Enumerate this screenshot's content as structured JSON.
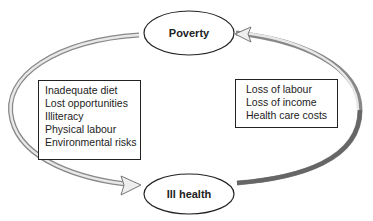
{
  "nodes": {
    "top": {
      "label": "Poverty"
    },
    "bottom": {
      "label": "Ill health"
    }
  },
  "boxes": {
    "left": {
      "items": [
        "Inadequate diet",
        "Lost opportunities",
        "Illiteracy",
        "Physical labour",
        "Environmental risks"
      ]
    },
    "right": {
      "items": [
        "Loss of labour",
        "Loss of income",
        "Health care costs"
      ]
    }
  },
  "colors": {
    "arrow": "#6e6e6e",
    "stroke": "#222222"
  }
}
